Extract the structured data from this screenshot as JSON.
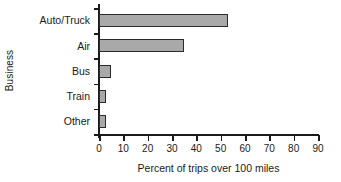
{
  "chart_data": {
    "type": "bar",
    "orientation": "horizontal",
    "title": "",
    "categories": [
      "Auto/Truck",
      "Air",
      "Bus",
      "Train",
      "Other"
    ],
    "values": [
      53,
      35,
      5,
      3,
      3
    ],
    "xlabel": "Percent of trips over 100 miles",
    "ylabel": "Business",
    "xlim": [
      0,
      90
    ],
    "xticks": [
      0,
      10,
      20,
      30,
      40,
      50,
      60,
      70,
      80,
      90
    ],
    "xticklabels": [
      "0",
      "10",
      "20",
      "30",
      "40",
      "50",
      "60",
      "70",
      "80",
      "90"
    ],
    "grid": false,
    "legend": null,
    "bar_fill_color": "#a9a9a9",
    "bar_edge_color": "#2b2b2b",
    "axis_color": "#1a1a1a",
    "background_color": "#ffffff"
  }
}
